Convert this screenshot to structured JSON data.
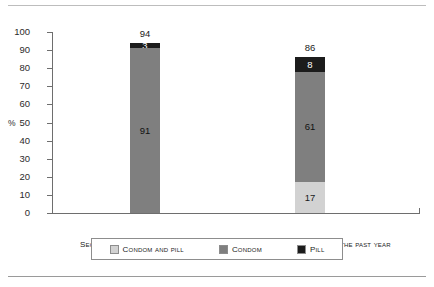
{
  "chart_data": {
    "type": "bar",
    "stacked": true,
    "title": "",
    "subtitle": "",
    "xlabel": "",
    "ylabel": "%",
    "ylim": [
      0,
      100
    ],
    "yticks": [
      0,
      10,
      20,
      30,
      40,
      50,
      60,
      70,
      80,
      90,
      100
    ],
    "ytick_labels": [
      "0",
      "10",
      "20",
      "30",
      "40",
      "50",
      "60",
      "70",
      "80",
      "90",
      "100"
    ],
    "grid": false,
    "legend_position": "bottom",
    "categories": [
      "Secure methods use the first time",
      "Secure methods used during the past year"
    ],
    "series": [
      {
        "name": "Condom and pill",
        "color": "#d2d2d2",
        "values": [
          0,
          17
        ]
      },
      {
        "name": "Condom",
        "color": "#7f7f7f",
        "values": [
          91,
          61
        ]
      },
      {
        "name": "Pill",
        "color": "#1c1c1c",
        "values": [
          3,
          8
        ]
      }
    ],
    "totals": [
      94,
      86
    ],
    "bars": [
      {
        "category": "Secure methods use the first time",
        "total_label": "94",
        "segments": [
          {
            "series": "Pill",
            "value": 3,
            "label": "3",
            "color": "#1c1c1c",
            "label_color": "#ffffff"
          },
          {
            "series": "Condom",
            "value": 91,
            "label": "91",
            "color": "#7f7f7f",
            "label_color": "#111111"
          },
          {
            "series": "Condom and pill",
            "value": 0,
            "label": "",
            "color": "#d2d2d2",
            "label_color": "#1a1a1a"
          }
        ]
      },
      {
        "category": "Secure methods used during the past year",
        "total_label": "86",
        "segments": [
          {
            "series": "Pill",
            "value": 8,
            "label": "8",
            "color": "#1c1c1c",
            "label_color": "#ffffff"
          },
          {
            "series": "Condom",
            "value": 61,
            "label": "61",
            "color": "#7f7f7f",
            "label_color": "#111111"
          },
          {
            "series": "Condom and pill",
            "value": 17,
            "label": "17",
            "color": "#d2d2d2",
            "label_color": "#1a1a1a"
          }
        ]
      }
    ]
  },
  "axis": {
    "y_unit_label": "%",
    "ticks": [
      "100",
      "90",
      "80",
      "70",
      "60",
      "50",
      "40",
      "30",
      "20",
      "10",
      "0"
    ]
  },
  "legend": {
    "items": [
      {
        "label": "Condom and pill",
        "color": "#d2d2d2"
      },
      {
        "label": "Condom",
        "color": "#7f7f7f"
      },
      {
        "label": "Pill",
        "color": "#1c1c1c"
      }
    ]
  }
}
